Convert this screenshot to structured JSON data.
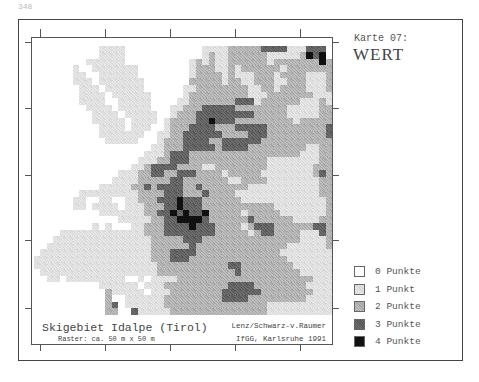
{
  "page_number": "348",
  "map": {
    "title": "Skigebiet Idalpe (Tirol)",
    "raster": "Raster: ca. 50 m x 50 m",
    "credit_line1": "Lenz/Schwarz-v.Raumer",
    "credit_line2": "IfGG, Karlsruhe  1991",
    "cols": 46,
    "rows": [
      "0000000000000000000000000000000000000000000000",
      "0000000000111100000000000011112222233331113330",
      "0000000000111100000000000012112222221111124340",
      "0000000011111100000000001212112222221222222242",
      "0000001001111111000000001222112122222212222222",
      "0000001100111111000000001222212111222122221112",
      "0000001110111111100000002222212211222112221112",
      "0000000111011111100000011222222221122122221112",
      "0000000111101111110000012222222221112222222111",
      "0000000111100111110000112222222333122222211121",
      "0000000011110111110001122233333222222221111122",
      "0000000001111011111001222333333333222221111122",
      "0000000001111101111012222334333222222222122222",
      "0000000000111101110012223333222333332222222223",
      "0000000000111111100112233333322223332222222223",
      "0000000000011111000122233332233333322222222222",
      "0000000000000000001122233333233332222222221122",
      "0000000000000000011123332222222222222222211122",
      "0000000000000000111223332222222222221111111122",
      "0000000000000001123333222211222222221111111222",
      "0000000000000111223322333222212222211111111232",
      "0000000000001111222223322222221122221111111122",
      "0000000000111112232333322322222221111111111122",
      "0000000111111111222233322232222111111111111122",
      "0000001100110011222333433322222211111111111112",
      "0000001101111011122233433322222222222111111112",
      "0000000000111111122334343342222212222211111112",
      "0000000000000111112233444432222223222222111122",
      "0000000001010001122233334333222212333222222332",
      "0000111111111111122233333333222221233222211132",
      "0001111111111111112222233322222222222222211112",
      "0011111111111111112222223222222222222221111112",
      "0111111111111111112223333222222222222211111111",
      "1111111111111111112223332222222222222221111111",
      "1111111111111111111222222222223322222222111111",
      "0111111111111111111222222222222322222222211111",
      "0011011111111100101111222222222222222222222111",
      "0000000000111111011122222222223333222222221111",
      "0000000000021111101112222222233333322222222111",
      "0000000000020011111122222222233332222222221111",
      "0000000000023011111122222222222222221111111111",
      "0000000000022003111112222222222222221111111111"
    ]
  },
  "sheet": {
    "label": "Karte 07:",
    "title": "WERT"
  },
  "legend": [
    {
      "level": 0,
      "label": "0 Punkte"
    },
    {
      "level": 1,
      "label": "1 Punkt"
    },
    {
      "level": 2,
      "label": "2 Punkte"
    },
    {
      "level": 3,
      "label": "3 Punkte"
    },
    {
      "level": 4,
      "label": "4 Punkte"
    }
  ],
  "ticks": {
    "top_x": [
      40,
      105,
      170,
      235,
      300
    ],
    "bottom_x": [
      40,
      105,
      170,
      235,
      300
    ],
    "left_y": [
      42,
      108,
      175,
      240,
      308
    ],
    "right_y": [
      42,
      108,
      175,
      240,
      308
    ]
  }
}
